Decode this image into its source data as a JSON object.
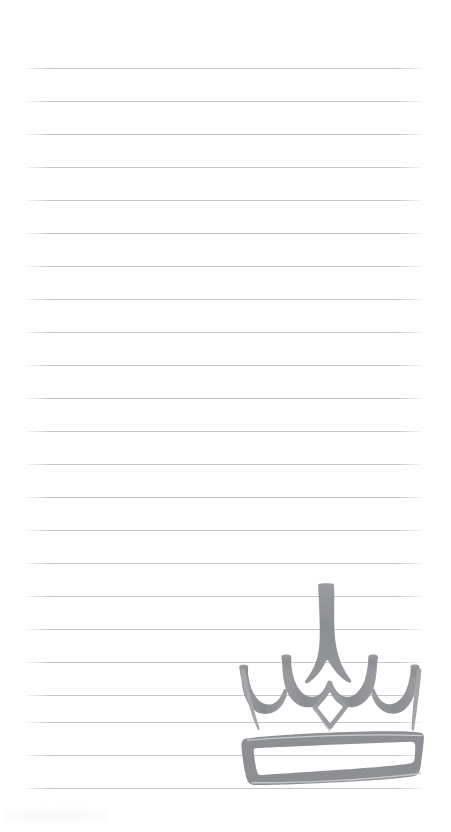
{
  "document": {
    "kind": "lined-notepad-page",
    "title": "Lined notepad page with hand-drawn crown",
    "page_width": 451,
    "page_height": 832,
    "paper_color": "#ffffff"
  },
  "ruled_lines": {
    "name": "ruled-lines",
    "color": "#b9bcc0",
    "thickness": 1,
    "left": 25,
    "right": 422,
    "count": 23,
    "spacing": 33,
    "y_positions": [
      68,
      101,
      134,
      167,
      200,
      233,
      266,
      299,
      332,
      365,
      398,
      431,
      464,
      497,
      530,
      563,
      596,
      629,
      662,
      695,
      722,
      755,
      788
    ]
  },
  "drawing": {
    "name": "crown-drawing",
    "label": "crown",
    "style": "hand-drawn marker sketch",
    "ink_color": "#8d8f92",
    "ink_color_light": "#a9abae",
    "bounds": {
      "x": 233,
      "y": 576,
      "width": 196,
      "height": 222
    },
    "parts": [
      {
        "name": "center-spike",
        "label": "tall center point"
      },
      {
        "name": "left-arch",
        "label": "left scallop arch"
      },
      {
        "name": "right-arch",
        "label": "right scallop arch"
      },
      {
        "name": "left-peak",
        "label": "left small peak"
      },
      {
        "name": "right-peak",
        "label": "right small peak"
      },
      {
        "name": "left-upright",
        "label": "left slanted side"
      },
      {
        "name": "right-upright",
        "label": "right slanted side"
      },
      {
        "name": "diamond-jewel",
        "label": "diamond gem outline"
      },
      {
        "name": "crown-band",
        "label": "base band"
      }
    ]
  },
  "smudge": {
    "name": "paper-smudge",
    "label": "faint pencil smudge"
  }
}
